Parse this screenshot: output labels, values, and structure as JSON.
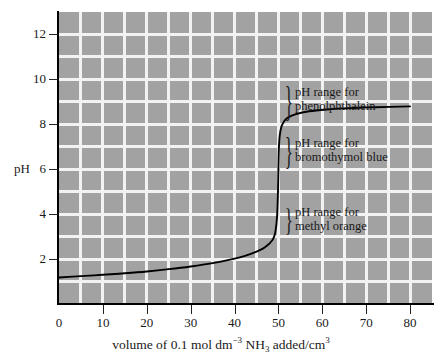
{
  "chart_data": {
    "type": "line",
    "title": "",
    "xlabel": "volume of 0.1 mol dm-3 NH3 added/cm3",
    "xlabel_parts": {
      "pre": "volume of 0.1 mol dm",
      "sup1": "−3",
      "mid": " NH",
      "sub1": "3",
      "post": " added/cm",
      "sup2": "3"
    },
    "ylabel": "pH",
    "xlim": [
      0,
      85
    ],
    "ylim": [
      0,
      13
    ],
    "x_ticks": [
      0,
      10,
      20,
      30,
      40,
      50,
      60,
      70,
      80
    ],
    "y_ticks": [
      2,
      4,
      6,
      8,
      10,
      12
    ],
    "grid": true,
    "grid_x_step": 5,
    "grid_y_step": 1,
    "grid_color": "#f2f2f2",
    "plot_bg": "#a2a2a2",
    "line_color": "#000000",
    "series": [
      {
        "name": "titration curve",
        "points": [
          [
            0,
            1.18
          ],
          [
            5,
            1.24
          ],
          [
            10,
            1.3
          ],
          [
            15,
            1.37
          ],
          [
            20,
            1.45
          ],
          [
            25,
            1.55
          ],
          [
            30,
            1.67
          ],
          [
            35,
            1.82
          ],
          [
            40,
            2.02
          ],
          [
            42,
            2.12
          ],
          [
            44,
            2.25
          ],
          [
            46,
            2.42
          ],
          [
            47,
            2.54
          ],
          [
            48,
            2.7
          ],
          [
            48.8,
            2.9
          ],
          [
            49.3,
            3.2
          ],
          [
            49.7,
            3.9
          ],
          [
            49.9,
            5.0
          ],
          [
            50.0,
            6.0
          ],
          [
            50.1,
            6.9
          ],
          [
            50.3,
            7.5
          ],
          [
            50.7,
            7.9
          ],
          [
            51.2,
            8.1
          ],
          [
            52,
            8.28
          ],
          [
            54,
            8.45
          ],
          [
            57,
            8.58
          ],
          [
            61,
            8.66
          ],
          [
            66,
            8.72
          ],
          [
            72,
            8.76
          ],
          [
            80,
            8.8
          ]
        ]
      }
    ],
    "annotations": [
      {
        "id": "phenolphthalein",
        "line1": "pH range for",
        "line2": "phenolphthalein",
        "brace": "}",
        "range_ph": [
          8.2,
          10.0
        ]
      },
      {
        "id": "bromothymol-blue",
        "line1": "pH range for",
        "line2": "bromothymol blue",
        "brace": "}",
        "range_ph": [
          6.0,
          7.6
        ]
      },
      {
        "id": "methyl-orange",
        "line1": "pH range for",
        "line2": "methyl orange",
        "brace": "}",
        "range_ph": [
          3.1,
          4.4
        ]
      }
    ]
  }
}
